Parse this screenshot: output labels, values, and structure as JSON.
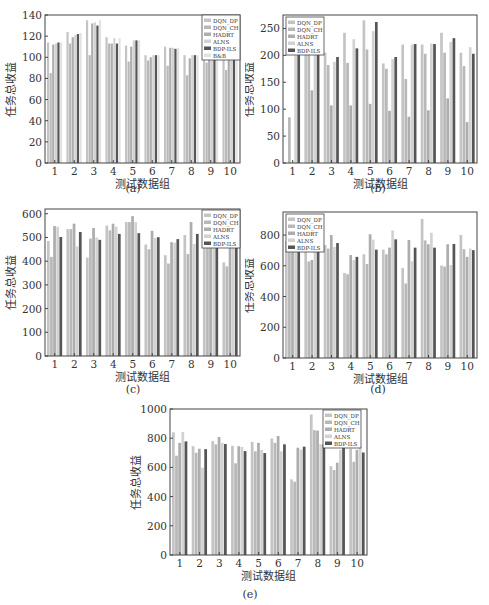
{
  "figure": {
    "ylabel": "任务总收益",
    "xlabel": "测试数据组",
    "series_colors": {
      "DQN_DP": "#c4c4c4",
      "DQN_CH": "#b8b8b8",
      "HADRT": "#adadad",
      "ALNS": "#d2d2d2",
      "BDP-ILS": "#555555",
      "B&B": "#e2e2e2"
    }
  },
  "chart_data": [
    {
      "id": "a",
      "caption": "(a)",
      "type": "bar",
      "title": "",
      "xlabel": "测试数据组",
      "ylabel": "任务总收益",
      "categories": [
        "1",
        "2",
        "3",
        "4",
        "5",
        "6",
        "7",
        "8",
        "9",
        "10"
      ],
      "ylim": [
        0,
        140
      ],
      "yticks": [
        0,
        20,
        40,
        60,
        80,
        100,
        120,
        140
      ],
      "legend_position": "upper right",
      "grid": false,
      "series": [
        {
          "name": "DQN_DP",
          "values": [
            114,
            124,
            135,
            119,
            111,
            102,
            110,
            102,
            116,
            106
          ]
        },
        {
          "name": "DQN_CH",
          "values": [
            85,
            113,
            102,
            113,
            96,
            97,
            92,
            83,
            95,
            88
          ]
        },
        {
          "name": "HADRT",
          "values": [
            112,
            119,
            132,
            113,
            110,
            100,
            109,
            99,
            110,
            106
          ]
        },
        {
          "name": "ALNS",
          "values": [
            113,
            121,
            133,
            118,
            116,
            102,
            109,
            102,
            115,
            105
          ]
        },
        {
          "name": "BDP-ILS",
          "values": [
            114,
            122,
            130,
            113,
            116,
            102,
            108,
            102,
            115,
            106
          ]
        },
        {
          "name": "B&B",
          "values": [
            114,
            123,
            135,
            118,
            116,
            102,
            109,
            102,
            116,
            106
          ]
        }
      ]
    },
    {
      "id": "b",
      "caption": "(b)",
      "type": "bar",
      "title": "",
      "xlabel": "测试数据组",
      "ylabel": "任务总收益",
      "categories": [
        "1",
        "2",
        "3",
        "4",
        "5",
        "6",
        "7",
        "8",
        "9",
        "10"
      ],
      "ylim": [
        0,
        275
      ],
      "yticks": [
        0,
        50,
        100,
        150,
        200,
        250
      ],
      "legend_position": "upper left",
      "grid": false,
      "series": [
        {
          "name": "DQN_DP",
          "values": [
            0,
            220,
            205,
            242,
            265,
            185,
            220,
            220,
            242,
            205
          ]
        },
        {
          "name": "DQN_CH",
          "values": [
            85,
            210,
            182,
            186,
            211,
            175,
            156,
            203,
            205,
            180
          ]
        },
        {
          "name": "HADRT",
          "values": [
            0,
            135,
            107,
            107,
            110,
            97,
            86,
            98,
            120,
            76
          ]
        },
        {
          "name": "ALNS",
          "values": [
            200,
            215,
            188,
            230,
            245,
            193,
            220,
            222,
            225,
            215
          ]
        },
        {
          "name": "BDP-ILS",
          "values": [
            202,
            222,
            197,
            213,
            262,
            197,
            221,
            221,
            232,
            203
          ]
        }
      ]
    },
    {
      "id": "c",
      "caption": "(c)",
      "type": "bar",
      "title": "",
      "xlabel": "测试数据组",
      "ylabel": "任务总收益",
      "categories": [
        "1",
        "2",
        "3",
        "4",
        "5",
        "6",
        "7",
        "8",
        "9",
        "10"
      ],
      "ylim": [
        0,
        620
      ],
      "yticks": [
        0,
        100,
        200,
        300,
        400,
        500,
        600
      ],
      "legend_position": "upper right",
      "grid": false,
      "series": [
        {
          "name": "DQN_DP",
          "values": [
            485,
            535,
            415,
            550,
            565,
            470,
            425,
            510,
            495,
            395
          ]
        },
        {
          "name": "DQN_CH",
          "values": [
            418,
            535,
            495,
            530,
            565,
            450,
            390,
            430,
            470,
            378
          ]
        },
        {
          "name": "HADRT",
          "values": [
            548,
            558,
            540,
            558,
            590,
            528,
            480,
            565,
            505,
            460
          ]
        },
        {
          "name": "ALNS",
          "values": [
            545,
            462,
            500,
            545,
            565,
            498,
            478,
            472,
            490,
            485
          ]
        },
        {
          "name": "BDP-ILS",
          "values": [
            502,
            523,
            490,
            515,
            518,
            501,
            493,
            515,
            498,
            490
          ]
        }
      ]
    },
    {
      "id": "d",
      "caption": "(d)",
      "type": "bar",
      "title": "",
      "xlabel": "测试数据组",
      "ylabel": "任务总收益",
      "categories": [
        "1",
        "2",
        "3",
        "4",
        "5",
        "6",
        "7",
        "8",
        "9",
        "10"
      ],
      "ylim": [
        0,
        950
      ],
      "yticks": [
        0,
        200,
        400,
        600,
        800
      ],
      "legend_position": "upper left",
      "grid": false,
      "series": [
        {
          "name": "DQN_DP",
          "values": [
            760,
            700,
            735,
            553,
            675,
            705,
            585,
            905,
            602,
            800
          ]
        },
        {
          "name": "DQN_CH",
          "values": [
            720,
            628,
            712,
            545,
            612,
            675,
            485,
            765,
            595,
            708
          ]
        },
        {
          "name": "HADRT",
          "values": [
            760,
            638,
            800,
            670,
            805,
            718,
            768,
            740,
            740,
            658
          ]
        },
        {
          "name": "ALNS",
          "values": [
            740,
            705,
            722,
            638,
            770,
            830,
            630,
            815,
            605,
            712
          ]
        },
        {
          "name": "BDP-ILS",
          "values": [
            695,
            732,
            748,
            658,
            705,
            772,
            718,
            718,
            742,
            702
          ]
        }
      ]
    },
    {
      "id": "e",
      "caption": "(e)",
      "type": "bar",
      "title": "",
      "xlabel": "测试数据组",
      "ylabel": "任务总收益",
      "categories": [
        "1",
        "2",
        "3",
        "4",
        "5",
        "6",
        "7",
        "8",
        "9",
        "10"
      ],
      "ylim": [
        0,
        1000
      ],
      "yticks": [
        0,
        200,
        400,
        600,
        800,
        1000
      ],
      "legend_position": "upper right",
      "grid": false,
      "series": [
        {
          "name": "DQN_DP",
          "values": [
            840,
            745,
            780,
            748,
            775,
            798,
            518,
            962,
            608,
            728
          ]
        },
        {
          "name": "DQN_CH",
          "values": [
            680,
            700,
            758,
            628,
            710,
            768,
            502,
            855,
            582,
            638
          ]
        },
        {
          "name": "HADRT",
          "values": [
            768,
            728,
            808,
            745,
            768,
            815,
            735,
            852,
            632,
            720
          ]
        },
        {
          "name": "ALNS",
          "values": [
            842,
            598,
            768,
            740,
            720,
            710,
            722,
            758,
            720,
            745
          ]
        },
        {
          "name": "BDP-ILS",
          "values": [
            778,
            725,
            760,
            712,
            698,
            758,
            742,
            758,
            755,
            702
          ]
        }
      ]
    }
  ]
}
